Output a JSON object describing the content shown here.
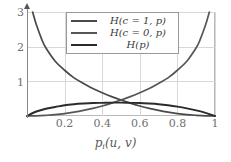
{
  "chart_data": {
    "type": "line",
    "title": "",
    "xlabel": "p_i(u, v)",
    "xlabel_parts": {
      "base": "p",
      "subscript": "i",
      "args": "(u, v)"
    },
    "ylabel": "",
    "xlim": [
      0,
      1
    ],
    "ylim": [
      0,
      3
    ],
    "xticks": [
      "0.2",
      "0.4",
      "0.6",
      "0.8",
      "1"
    ],
    "xtick_values": [
      0.2,
      0.4,
      0.6,
      0.8,
      1
    ],
    "yticks": [
      "1",
      "2",
      "3"
    ],
    "ytick_values": [
      1,
      2,
      3
    ],
    "grid": true,
    "legend_position": "upper center",
    "series": [
      {
        "name": "H(c = 1, p)",
        "color": "#4a4a4a",
        "formula": "-log2(p)",
        "x": [
          0.03,
          0.05,
          0.08,
          0.1,
          0.15,
          0.2,
          0.25,
          0.3,
          0.35,
          0.4,
          0.45,
          0.5,
          0.55,
          0.6,
          0.65,
          0.7,
          0.75,
          0.8,
          0.85,
          0.9,
          0.95,
          1.0
        ],
        "values": [
          3.0,
          2.63,
          2.19,
          1.97,
          1.58,
          1.32,
          1.1,
          0.94,
          0.79,
          0.67,
          0.56,
          0.46,
          0.37,
          0.29,
          0.22,
          0.16,
          0.11,
          0.07,
          0.04,
          0.02,
          0.005,
          0.0
        ]
      },
      {
        "name": "H(c = 0, p)",
        "color": "#565656",
        "formula": "-log2(1 - p)",
        "x": [
          0.0,
          0.05,
          0.1,
          0.15,
          0.2,
          0.25,
          0.3,
          0.35,
          0.4,
          0.45,
          0.5,
          0.55,
          0.6,
          0.65,
          0.7,
          0.75,
          0.8,
          0.85,
          0.9,
          0.92,
          0.95,
          0.97
        ],
        "values": [
          0.0,
          0.005,
          0.02,
          0.04,
          0.07,
          0.11,
          0.16,
          0.22,
          0.29,
          0.37,
          0.46,
          0.56,
          0.67,
          0.79,
          0.94,
          1.1,
          1.32,
          1.58,
          1.97,
          2.19,
          2.63,
          3.0
        ]
      },
      {
        "name": "H(p)",
        "color": "#2b2b2b",
        "formula": "binary entropy (scaled)",
        "x": [
          0.0,
          0.05,
          0.1,
          0.15,
          0.2,
          0.25,
          0.3,
          0.35,
          0.4,
          0.45,
          0.5,
          0.55,
          0.6,
          0.65,
          0.7,
          0.75,
          0.8,
          0.85,
          0.9,
          0.95,
          1.0
        ],
        "values": [
          0.0,
          0.13,
          0.21,
          0.26,
          0.31,
          0.34,
          0.36,
          0.375,
          0.38,
          0.385,
          0.385,
          0.38,
          0.375,
          0.36,
          0.34,
          0.31,
          0.27,
          0.22,
          0.16,
          0.09,
          0.0
        ]
      }
    ]
  },
  "legend": {
    "entries": [
      {
        "label": "H(c = 1, p)"
      },
      {
        "label": "H(c = 0, p)"
      },
      {
        "label": "H(p)"
      }
    ]
  },
  "axis": {
    "x_tick_labels": [
      "0.2",
      "0.4",
      "0.6",
      "0.8",
      "1"
    ],
    "y_tick_labels": [
      "3",
      "2",
      "1"
    ]
  },
  "colors": {
    "series_1": "#4a4a4a",
    "series_2": "#565656",
    "series_3": "#2b2b2b",
    "grid": "#d8d8d8",
    "frame": "#b9b9b9",
    "axis": "#8a8a8a",
    "tick_text": "#6f6f6f",
    "background": "#ffffff"
  }
}
